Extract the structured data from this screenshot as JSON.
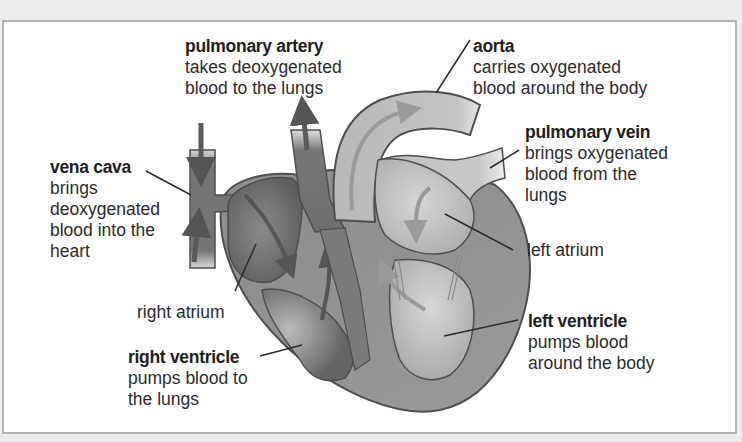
{
  "diagram": {
    "colors": {
      "deoxygenated_side": "#6b6b6b",
      "oxygenated_side": "#bdbdbd",
      "outline": "#505050",
      "frame_border": "#b4b4b4",
      "background": "#ffffff"
    },
    "labels": {
      "pulmonary_artery": {
        "title": "pulmonary artery",
        "description": "takes deoxygenated\nblood to the lungs"
      },
      "aorta": {
        "title": "aorta",
        "description": "carries oxygenated\nblood around the body"
      },
      "pulmonary_vein": {
        "title": "pulmonary vein",
        "description": "brings oxygenated\nblood from the\nlungs"
      },
      "vena_cava": {
        "title": "vena cava",
        "description": "brings\ndeoxygenated\nblood into the\nheart"
      },
      "left_atrium": {
        "title": "",
        "description": "left atrium"
      },
      "right_atrium": {
        "title": "",
        "description": "right atrium"
      },
      "left_ventricle": {
        "title": "left ventricle",
        "description": "pumps blood\naround the body"
      },
      "right_ventricle": {
        "title": "right ventricle",
        "description": "pumps blood to\nthe lungs"
      }
    }
  }
}
